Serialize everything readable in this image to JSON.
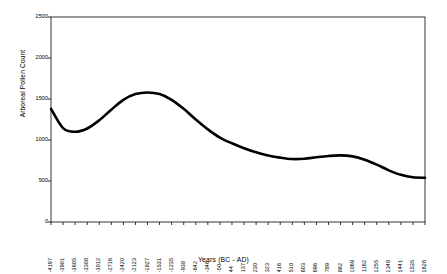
{
  "chart_data": {
    "type": "line",
    "title": "",
    "xlabel": "Years (BC - AD)",
    "ylabel": "Arboreal Pollen Count",
    "ylim": [
      0,
      2500
    ],
    "ytick_labels": [
      "0",
      "500",
      "1000",
      "1500",
      "2000",
      "2500"
    ],
    "ytick_values": [
      0,
      500,
      1000,
      1500,
      2000,
      2500
    ],
    "grid": false,
    "legend": false,
    "legend_position": "none",
    "line_color": "#000000",
    "background_color": "#ffffff",
    "categories": [
      "-4197",
      "-3901",
      "-3605",
      "-3308",
      "-3012",
      "-2716",
      "-2420",
      "-2123",
      "-1827",
      "-1531",
      "-1235",
      "-938",
      "-642",
      "-346",
      "-50",
      "44",
      "137",
      "230",
      "323",
      "416",
      "510",
      "603",
      "696",
      "789",
      "882",
      "1069",
      "1162",
      "1255",
      "1348",
      "1441",
      "1535",
      "1628"
    ],
    "values": [
      1380,
      1145,
      1100,
      1140,
      1240,
      1370,
      1490,
      1560,
      1580,
      1560,
      1490,
      1380,
      1250,
      1130,
      1030,
      960,
      900,
      850,
      812,
      785,
      768,
      772,
      790,
      805,
      812,
      800,
      760,
      700,
      630,
      575,
      545,
      540
    ]
  },
  "axis": {
    "y_title": "Arboreal Pollen Count",
    "x_title": "Years (BC - AD)"
  }
}
